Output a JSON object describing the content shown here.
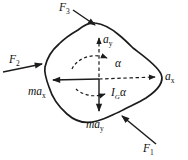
{
  "diagram": {
    "colors": {
      "stroke": "#1c1c1c",
      "background": "#ffffff"
    },
    "labels": {
      "F1": {
        "base": "F",
        "sub": "1"
      },
      "F2": {
        "base": "F",
        "sub": "2"
      },
      "F3": {
        "base": "F",
        "sub": "3"
      },
      "ax": {
        "base": "a",
        "sub": "x"
      },
      "ay": {
        "base": "a",
        "sub": "y"
      },
      "max": {
        "base": "ma",
        "sub": "x"
      },
      "may": {
        "base": "ma",
        "sub": "y"
      },
      "alpha": "α",
      "Ialpha": {
        "base": "I",
        "sub": "G",
        "suffix": "α"
      }
    }
  }
}
